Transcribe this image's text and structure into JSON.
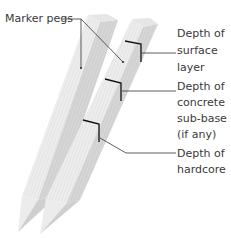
{
  "labels": {
    "marker_pegs": "Marker pegs",
    "surface": [
      "Depth of",
      "surface",
      "layer"
    ],
    "subbase": [
      "Depth of",
      "concrete",
      "sub-base",
      "(if any)"
    ],
    "hardcore": [
      "Depth of",
      "hardcore"
    ]
  },
  "colors": {
    "peg_face_light": "#f0f0f0",
    "peg_face_mid": "#dcdcdc",
    "peg_face_dark": "#c4c4c4",
    "line": "#333333",
    "mark": "#111111"
  }
}
